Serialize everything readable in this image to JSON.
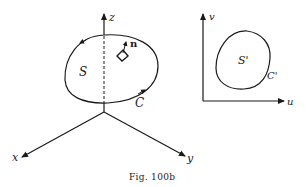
{
  "figure": {
    "caption": "Fig. 100b",
    "colors": {
      "ink": "#1a1a1a",
      "background": "#ffffff"
    }
  },
  "left_diagram": {
    "axes": {
      "x": "x",
      "y": "y",
      "z": "z"
    },
    "surface_label": "S",
    "curve_label": "C",
    "normal_label": "n"
  },
  "right_diagram": {
    "axes": {
      "u": "u",
      "v": "v"
    },
    "surface_label": "S'",
    "curve_label": "C'"
  }
}
